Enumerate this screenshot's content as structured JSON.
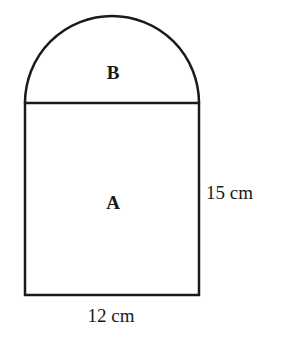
{
  "diagram": {
    "shapes": [
      {
        "id": "A",
        "type": "rectangle",
        "label": "A"
      },
      {
        "id": "B",
        "type": "semicircle",
        "label": "B"
      }
    ],
    "dimensions": {
      "height_label": "15 cm",
      "width_label": "12 cm"
    },
    "colors": {
      "stroke": "#1a1a1a",
      "background": "#ffffff"
    }
  }
}
